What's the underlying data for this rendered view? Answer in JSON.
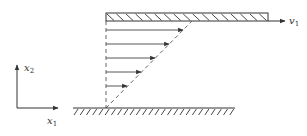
{
  "diagram": {
    "colors": {
      "stroke": "#333333",
      "dashed": "#555555",
      "background": "#ffffff"
    },
    "labels": {
      "plate_velocity": "v",
      "plate_velocity_sub": "1",
      "axis_vertical": "x",
      "axis_vertical_sub": "2",
      "axis_horizontal": "x",
      "axis_horizontal_sub": "1"
    },
    "top_plate": {
      "x": 106,
      "y": 13,
      "width": 162,
      "height": 8,
      "hatch_count": 17
    },
    "ground": {
      "x1": 73,
      "x2": 235,
      "y": 108,
      "hatch_count": 26
    },
    "velocity_arrows": [
      {
        "y": 30,
        "x_end": 183
      },
      {
        "y": 44,
        "x_end": 169
      },
      {
        "y": 58,
        "x_end": 155
      },
      {
        "y": 72,
        "x_end": 141
      },
      {
        "y": 86,
        "x_end": 127
      }
    ],
    "axes": {
      "origin_x": 17,
      "origin_y": 108,
      "x_end": 58,
      "y_end": 65
    }
  }
}
